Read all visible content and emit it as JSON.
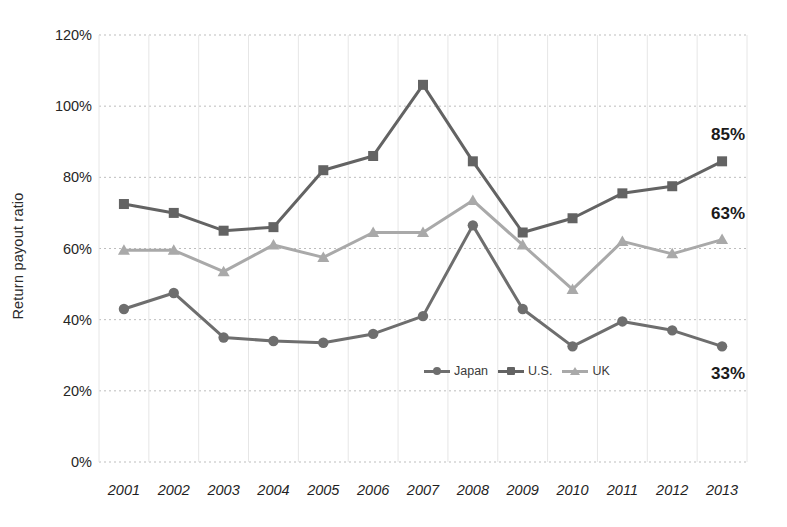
{
  "chart_data": {
    "type": "line",
    "title": "",
    "xlabel": "",
    "ylabel": "Return payout ratio",
    "ylim": [
      0,
      120
    ],
    "ytick_labels": [
      "0%",
      "20%",
      "40%",
      "60%",
      "80%",
      "100%",
      "120%"
    ],
    "ytick_values": [
      0,
      20,
      40,
      60,
      80,
      100,
      120
    ],
    "grid": true,
    "legend_position": "inside-bottom-right",
    "categories": [
      "2001",
      "2002",
      "2003",
      "2004",
      "2005",
      "2006",
      "2007",
      "2008",
      "2009",
      "2010",
      "2011",
      "2012",
      "2013"
    ],
    "series": [
      {
        "name": "Japan",
        "color": "#6e6e6e",
        "marker": "circle",
        "values": [
          43,
          47.5,
          35,
          34,
          33.5,
          36,
          41,
          66.5,
          43,
          32.5,
          39.5,
          37,
          32.5
        ],
        "end_label": "33%"
      },
      {
        "name": "U.S.",
        "color": "#636363",
        "marker": "square",
        "values": [
          72.5,
          70,
          65,
          66,
          82,
          86,
          106,
          84.5,
          64.5,
          68.5,
          75.5,
          77.5,
          84.5
        ],
        "end_label": "85%"
      },
      {
        "name": "UK",
        "color": "#a9a9a9",
        "marker": "triangle",
        "values": [
          59.5,
          59.5,
          53.5,
          61,
          57.5,
          64.5,
          64.5,
          73.5,
          61,
          48.5,
          62,
          58.5,
          62.5
        ],
        "end_label": "63%"
      }
    ]
  },
  "legend": {
    "items": [
      {
        "label": "Japan"
      },
      {
        "label": "U.S."
      },
      {
        "label": "UK"
      }
    ]
  },
  "axes": {
    "y_title": "Return payout ratio"
  }
}
